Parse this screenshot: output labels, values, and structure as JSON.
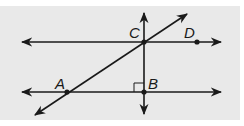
{
  "figure": {
    "background": "#e9e9e9",
    "stroke": "#1a1a1a",
    "points": {
      "A": {
        "label": "A",
        "x": 67,
        "y": 92
      },
      "B": {
        "label": "B",
        "x": 144,
        "y": 92
      },
      "C": {
        "label": "C",
        "x": 144,
        "y": 42
      },
      "D": {
        "label": "D",
        "x": 197,
        "y": 42
      }
    },
    "lines": [
      {
        "name": "line-CD",
        "desc": "horizontal line through C and D"
      },
      {
        "name": "line-AB",
        "desc": "horizontal line through A and B"
      },
      {
        "name": "line-AC",
        "desc": "transversal through A and C"
      },
      {
        "name": "line-CB",
        "desc": "vertical line through C and B"
      }
    ],
    "right_angle_marker": "at B"
  }
}
